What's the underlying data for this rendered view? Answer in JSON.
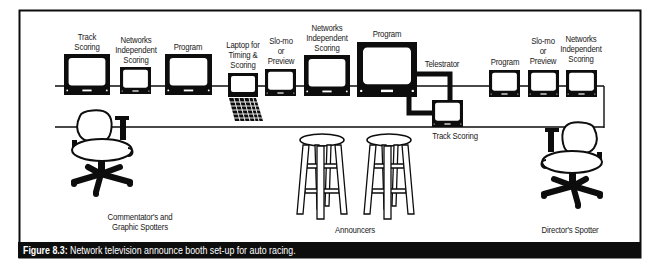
{
  "figure": {
    "caption_number": "Figure 8.3:",
    "caption_text": " Network television announce booth set-up for auto racing."
  },
  "equipment": {
    "monitors": [
      {
        "label": "Track\nScoring"
      },
      {
        "label": "Networks\nIndependent\nScoring"
      },
      {
        "label": "Program"
      },
      {
        "label": "Laptop for\nTiming &\nScoring"
      },
      {
        "label": "Slo-mo\nor\nPreview"
      },
      {
        "label": "Networks\nIndependent\nScoring"
      },
      {
        "label": "Program"
      },
      {
        "label": "Telestrator"
      },
      {
        "label": "Track Scoring"
      },
      {
        "label": "Program"
      },
      {
        "label": "Slo-mo\nor\nPreview"
      },
      {
        "label": "Networks\nIndependent\nScoring"
      }
    ]
  },
  "seating": {
    "commentators": "Commentator's and\nGraphic Spotters",
    "announcers": "Announcers",
    "director": "Director's Spotter"
  },
  "colors": {
    "ink": "#0d0d0d",
    "paper": "#ffffff"
  }
}
